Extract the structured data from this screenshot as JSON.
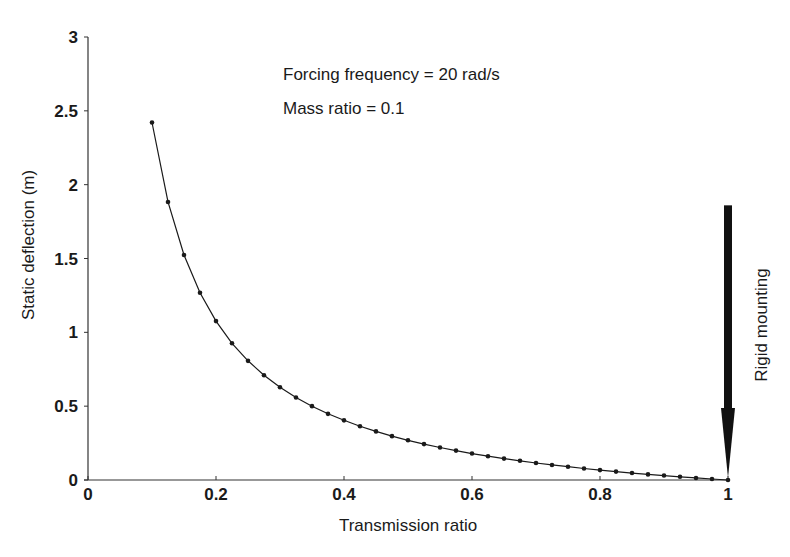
{
  "chart_data": {
    "type": "line",
    "title": "",
    "xlabel": "Transmission ratio",
    "ylabel": "Static deflection (m)",
    "xlim": [
      0,
      1
    ],
    "ylim": [
      0,
      3
    ],
    "xticks": [
      0,
      0.2,
      0.4,
      0.6,
      0.8,
      1
    ],
    "xtick_labels": [
      "0",
      "0.2",
      "0.4",
      "0.6",
      "0.8",
      "1"
    ],
    "yticks": [
      0,
      0.5,
      1,
      1.5,
      2,
      2.5,
      3
    ],
    "ytick_labels": [
      "0",
      "0.5",
      "1",
      "1.5",
      "2",
      "2.5",
      "3"
    ],
    "grid": false,
    "legend": null,
    "annotations": [
      {
        "text": "Forcing frequency = 20 rad/s",
        "x": 0.305,
        "y": 2.74
      },
      {
        "text": "Mass ratio = 0.1",
        "x": 0.305,
        "y": 2.4
      },
      {
        "text": "Rigid mounting",
        "x": 1.04,
        "y": 1.0,
        "rotation": -90,
        "arrow": {
          "from": [
            1,
            1.86
          ],
          "to": [
            1,
            0
          ]
        }
      }
    ],
    "series": [
      {
        "name": "Static deflection",
        "marker": "dot",
        "x": [
          0.1,
          0.125,
          0.15,
          0.175,
          0.2,
          0.225,
          0.25,
          0.275,
          0.3,
          0.325,
          0.35,
          0.375,
          0.4,
          0.425,
          0.45,
          0.475,
          0.5,
          0.525,
          0.55,
          0.575,
          0.6,
          0.625,
          0.65,
          0.675,
          0.7,
          0.725,
          0.75,
          0.775,
          0.8,
          0.825,
          0.85,
          0.875,
          0.9,
          0.925,
          0.95,
          0.975,
          1.0
        ],
        "y": [
          2.421,
          1.883,
          1.524,
          1.268,
          1.076,
          0.926,
          0.807,
          0.709,
          0.628,
          0.559,
          0.5,
          0.448,
          0.404,
          0.364,
          0.329,
          0.297,
          0.269,
          0.243,
          0.22,
          0.199,
          0.179,
          0.161,
          0.145,
          0.13,
          0.115,
          0.102,
          0.09,
          0.078,
          0.067,
          0.057,
          0.047,
          0.038,
          0.03,
          0.022,
          0.014,
          0.007,
          0.0
        ]
      }
    ]
  },
  "plot": {
    "x0_px": 88,
    "x1_px": 728,
    "y0_px": 480,
    "y1_px": 37,
    "line_color": "#1a1a1a",
    "arrow_color": "#111111"
  }
}
